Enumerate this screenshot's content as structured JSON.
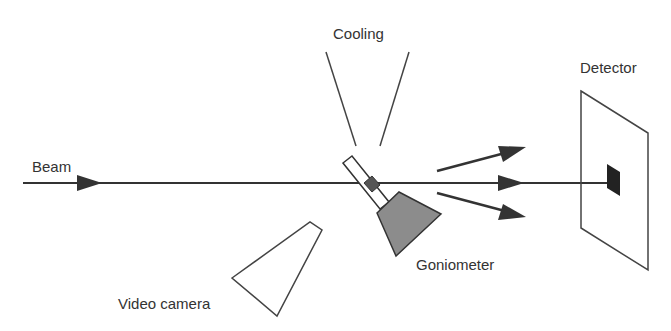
{
  "diagram": {
    "labels": {
      "cooling": "Cooling",
      "beam": "Beam",
      "detector": "Detector",
      "goniometer": "Goniometer",
      "video_camera": "Video camera"
    },
    "colors": {
      "line": "#333333",
      "goniometer_fill": "#8c8c8c",
      "crystal_fill": "#555555",
      "spot_fill": "#222222",
      "text": "#333333"
    },
    "components": [
      "beam",
      "cooling-nozzle",
      "crystal-pin",
      "goniometer",
      "video-camera",
      "diffracted-beams",
      "detector"
    ]
  }
}
